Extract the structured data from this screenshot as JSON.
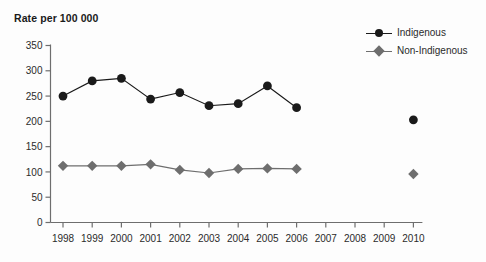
{
  "chart_data": {
    "type": "line",
    "title": "Rate per 100 000",
    "xlabel": "",
    "ylabel": "",
    "ylim": [
      0,
      350
    ],
    "ytick_step": 50,
    "yticks": [
      "0",
      "50",
      "100",
      "150",
      "200",
      "250",
      "300",
      "350"
    ],
    "grid": false,
    "legend_position": "top-right",
    "categories": [
      "1998",
      "1999",
      "2000",
      "2001",
      "2002",
      "2003",
      "2004",
      "2005",
      "2006",
      "2007",
      "2008",
      "2009",
      "2010"
    ],
    "series": [
      {
        "name": "Indigenous",
        "color": "#1a1a1a",
        "marker": "circle",
        "values": [
          250,
          280,
          285,
          244,
          257,
          231,
          235,
          270,
          227,
          null,
          null,
          null,
          203
        ]
      },
      {
        "name": "Non-Indigenous",
        "color": "#6e6e6e",
        "marker": "diamond",
        "values": [
          112,
          112,
          112,
          115,
          104,
          98,
          106,
          107,
          106,
          null,
          null,
          null,
          96
        ]
      }
    ]
  },
  "legend": {
    "items": [
      {
        "label": "Indigenous"
      },
      {
        "label": "Non-Indigenous"
      }
    ]
  },
  "colors": {
    "indigenous": "#1a1a1a",
    "non_indigenous": "#6e6e6e",
    "axis": "#6e6e6e",
    "text": "#2b2b2b"
  }
}
